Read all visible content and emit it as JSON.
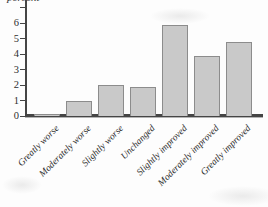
{
  "colors": {
    "background": "#fdfdfd",
    "bar_fill": "#c9c9c9",
    "bar_border": "#8c8c8c",
    "axis": "#454545",
    "text": "#2f2f2f"
  },
  "chart_data": {
    "type": "bar",
    "title": "",
    "ylabel": "percent",
    "xlabel": "",
    "categories": [
      "Greatly worse",
      "Moderately worse",
      "Slightly worse",
      "Unchanged",
      "Slightly improved",
      "Moderately improved",
      "Greatly improved"
    ],
    "values": [
      0.1,
      1.0,
      2.0,
      1.9,
      5.9,
      3.9,
      4.8
    ],
    "yticks": [
      0,
      1,
      2,
      3,
      4,
      5,
      6
    ],
    "ylim": [
      0,
      7.1
    ],
    "grid": false,
    "legend": "none",
    "bar_label_rotation_deg": -45
  }
}
